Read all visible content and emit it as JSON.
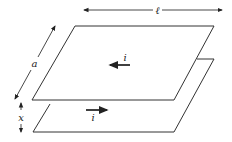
{
  "diagram": {
    "labels": {
      "length": "ℓ",
      "width": "a",
      "separation": "x",
      "current_top": "i",
      "current_bottom": "i"
    },
    "colors": {
      "stroke": "#333333",
      "background": "#ffffff"
    }
  }
}
